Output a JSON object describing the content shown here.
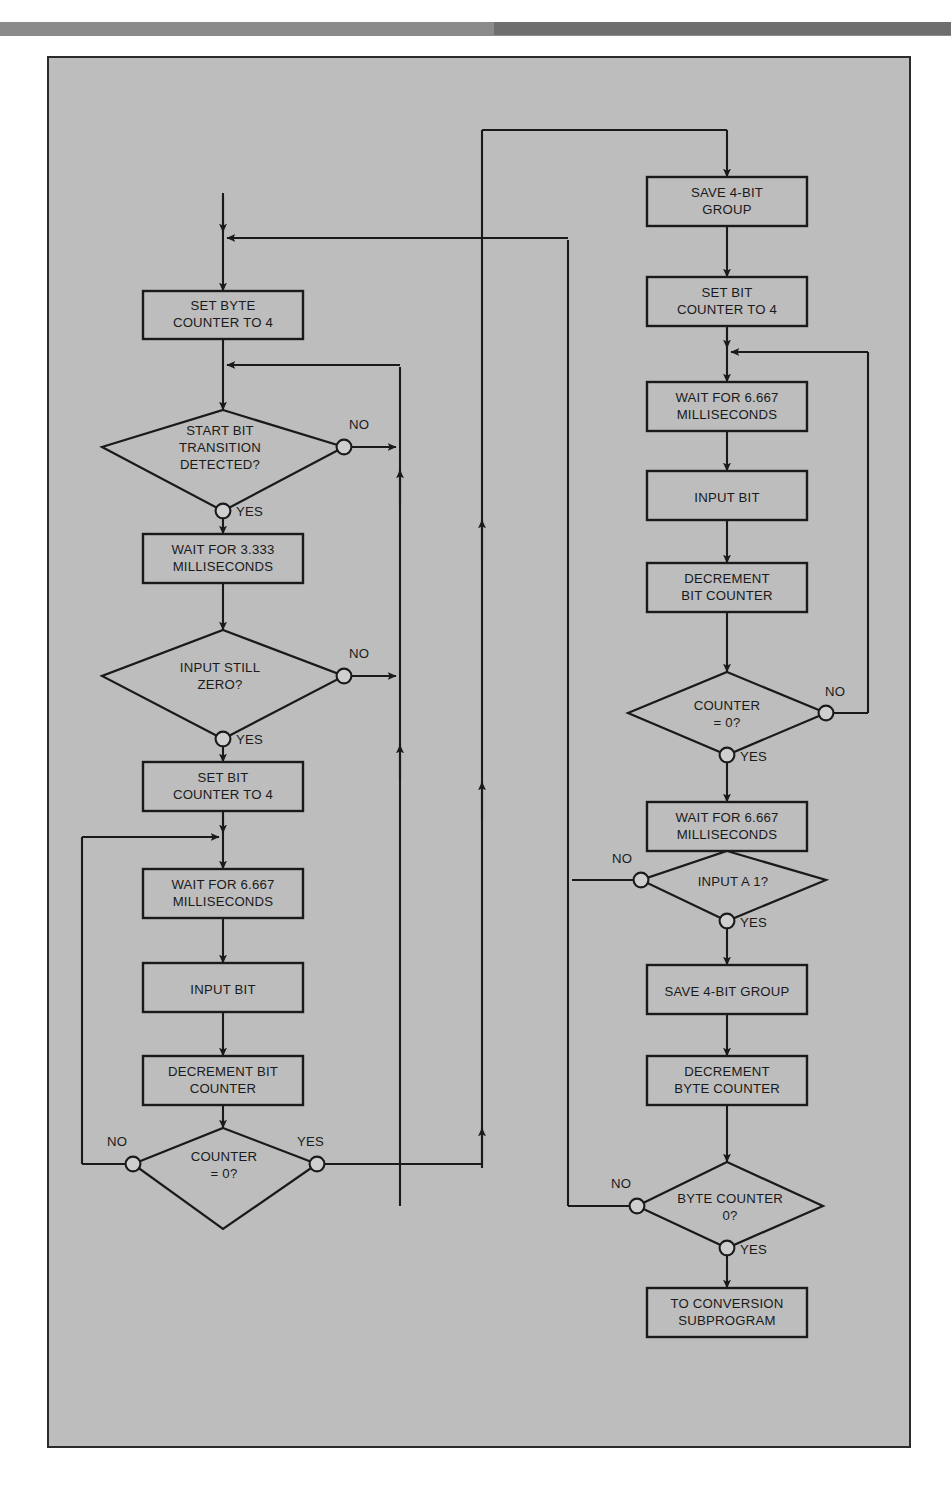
{
  "figure": {
    "kind": "flowchart"
  },
  "left_column": {
    "process_nodes": [
      {
        "id": "set-byte-counter",
        "lines": [
          "SET BYTE",
          "COUNTER TO 4"
        ]
      },
      {
        "id": "wait-3333",
        "lines": [
          "WAIT FOR 3.333",
          "MILLISECONDS"
        ]
      },
      {
        "id": "set-bit-counter",
        "lines": [
          "SET BIT",
          "COUNTER TO  4"
        ]
      },
      {
        "id": "wait-6667",
        "lines": [
          "WAIT FOR 6.667",
          "MILLISECONDS"
        ]
      },
      {
        "id": "input-bit",
        "lines": [
          "INPUT BIT"
        ]
      },
      {
        "id": "decrement-bit-counter",
        "lines": [
          "DECREMENT BIT",
          "COUNTER"
        ]
      }
    ],
    "decision_nodes": [
      {
        "id": "start-bit-transition",
        "lines": [
          "START BIT",
          "TRANSITION",
          "DETECTED?"
        ],
        "yes": "YES",
        "no": "NO"
      },
      {
        "id": "input-still-zero",
        "lines": [
          "INPUT STILL",
          "ZERO?"
        ],
        "yes": "YES",
        "no": "NO"
      },
      {
        "id": "counter-zero-left",
        "lines": [
          "COUNTER",
          "= 0?"
        ],
        "yes": "YES",
        "no": "NO"
      }
    ]
  },
  "right_column": {
    "process_nodes": [
      {
        "id": "save-4bit-group-top",
        "lines": [
          "SAVE 4-BIT",
          "GROUP"
        ]
      },
      {
        "id": "set-bit-counter-right",
        "lines": [
          "SET BIT",
          "COUNTER TO 4"
        ]
      },
      {
        "id": "wait-6667-right-a",
        "lines": [
          "WAIT FOR 6.667",
          "MILLISECONDS"
        ]
      },
      {
        "id": "input-bit-right",
        "lines": [
          "INPUT BIT"
        ]
      },
      {
        "id": "decrement-bit-counter-right",
        "lines": [
          "DECREMENT",
          "BIT COUNTER"
        ]
      },
      {
        "id": "wait-6667-right-b",
        "lines": [
          "WAIT FOR 6.667",
          "MILLISECONDS"
        ]
      },
      {
        "id": "save-4bit-group-bottom",
        "lines": [
          "SAVE 4-BIT GROUP"
        ]
      },
      {
        "id": "decrement-byte-counter",
        "lines": [
          "DECREMENT",
          "BYTE COUNTER"
        ]
      },
      {
        "id": "to-conversion-subprogram",
        "lines": [
          "TO CONVERSION",
          "SUBPROGRAM"
        ]
      }
    ],
    "decision_nodes": [
      {
        "id": "counter-zero-right",
        "lines": [
          "COUNTER",
          "= 0?"
        ],
        "yes": "YES",
        "no": "NO"
      },
      {
        "id": "input-a-one",
        "lines": [
          "INPUT A 1?"
        ],
        "yes": "YES",
        "no": "NO"
      },
      {
        "id": "byte-counter-zero",
        "lines": [
          "BYTE COUNTER",
          "0?"
        ],
        "yes": "YES",
        "no": "NO"
      }
    ]
  },
  "colors": {
    "panel_background": "#bdbdbd",
    "page_background": "#ffffff",
    "line": "#1a1a1a",
    "top_bar": "#8b8b8b",
    "top_bar_right": "#6e6e6e"
  }
}
